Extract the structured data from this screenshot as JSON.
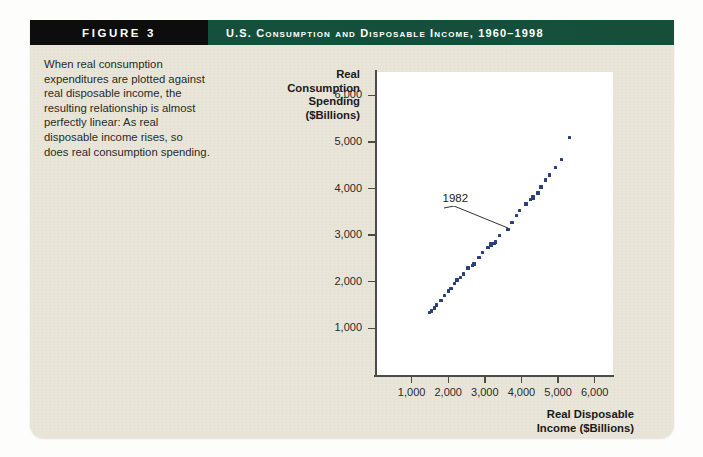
{
  "figure": {
    "tag": "FIGURE 3",
    "title": "U.S. Consumption and Disposable Income, 1960–1998",
    "caption": "When real consumption expenditures are plotted against real disposable income, the resulting relationship is almost perfectly linear: As real disposable income rises, so does real consumption spending.",
    "colors": {
      "tag_bar": "#0d0d0d",
      "title_bar": "#164e3a",
      "panel": "#e9e6d9",
      "plot_bg": "#ffffff",
      "marker": "#2b3f79",
      "axis": "#4b4b48"
    }
  },
  "chart_data": {
    "type": "scatter",
    "title": "U.S. Consumption and Disposable Income, 1960–1998",
    "xlabel": "Real Disposable Income ($Billions)",
    "ylabel": "Real Consumption Spending ($Billions)",
    "xlim": [
      0,
      6500
    ],
    "ylim": [
      0,
      6500
    ],
    "xticks": [
      1000,
      2000,
      3000,
      4000,
      5000,
      6000
    ],
    "xtick_labels": [
      "1,000",
      "2,000",
      "3,000",
      "4,000",
      "5,000",
      "6,000"
    ],
    "yticks": [
      1000,
      2000,
      3000,
      4000,
      5000,
      6000
    ],
    "ytick_labels": [
      "1,000",
      "2,000",
      "3,000",
      "4,000",
      "5,000",
      "6,000"
    ],
    "grid": false,
    "legend": false,
    "annotations": [
      {
        "label": "1982",
        "x": 3620,
        "y": 3150
      }
    ],
    "series": [
      {
        "name": "Consumption vs. Disposable Income",
        "marker_color": "#2b3f79",
        "points": [
          {
            "year": 1960,
            "x": 1495,
            "y": 1345
          },
          {
            "year": 1961,
            "x": 1545,
            "y": 1375
          },
          {
            "year": 1962,
            "x": 1620,
            "y": 1440
          },
          {
            "year": 1963,
            "x": 1680,
            "y": 1500
          },
          {
            "year": 1964,
            "x": 1800,
            "y": 1595
          },
          {
            "year": 1965,
            "x": 1905,
            "y": 1710
          },
          {
            "year": 1966,
            "x": 2000,
            "y": 1805
          },
          {
            "year": 1967,
            "x": 2075,
            "y": 1855
          },
          {
            "year": 1968,
            "x": 2170,
            "y": 1965
          },
          {
            "year": 1969,
            "x": 2240,
            "y": 2035
          },
          {
            "year": 1970,
            "x": 2340,
            "y": 2085
          },
          {
            "year": 1971,
            "x": 2425,
            "y": 2165
          },
          {
            "year": 1972,
            "x": 2545,
            "y": 2295
          },
          {
            "year": 1973,
            "x": 2700,
            "y": 2385
          },
          {
            "year": 1974,
            "x": 2665,
            "y": 2355
          },
          {
            "year": 1975,
            "x": 2720,
            "y": 2395
          },
          {
            "year": 1976,
            "x": 2840,
            "y": 2525
          },
          {
            "year": 1977,
            "x": 2940,
            "y": 2630
          },
          {
            "year": 1978,
            "x": 3085,
            "y": 2740
          },
          {
            "year": 1979,
            "x": 3165,
            "y": 2810
          },
          {
            "year": 1980,
            "x": 3180,
            "y": 2790
          },
          {
            "year": 1981,
            "x": 3255,
            "y": 2815
          },
          {
            "year": 1982,
            "x": 3290,
            "y": 2855
          },
          {
            "year": 1983,
            "x": 3395,
            "y": 2990
          },
          {
            "year": 1984,
            "x": 3630,
            "y": 3125
          },
          {
            "year": 1985,
            "x": 3740,
            "y": 3275
          },
          {
            "year": 1986,
            "x": 3870,
            "y": 3420
          },
          {
            "year": 1987,
            "x": 3950,
            "y": 3525
          },
          {
            "year": 1988,
            "x": 4120,
            "y": 3665
          },
          {
            "year": 1989,
            "x": 4245,
            "y": 3765
          },
          {
            "year": 1990,
            "x": 4310,
            "y": 3820
          },
          {
            "year": 1991,
            "x": 4325,
            "y": 3800
          },
          {
            "year": 1992,
            "x": 4450,
            "y": 3905
          },
          {
            "year": 1993,
            "x": 4530,
            "y": 4030
          },
          {
            "year": 1994,
            "x": 4655,
            "y": 4185
          },
          {
            "year": 1995,
            "x": 4765,
            "y": 4290
          },
          {
            "year": 1996,
            "x": 4925,
            "y": 4455
          },
          {
            "year": 1997,
            "x": 5100,
            "y": 4620
          },
          {
            "year": 1998,
            "x": 5320,
            "y": 5095
          }
        ]
      }
    ]
  }
}
